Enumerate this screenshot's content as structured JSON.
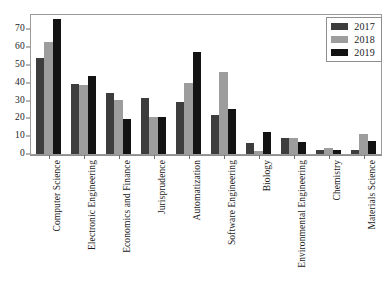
{
  "chart_data": {
    "type": "bar",
    "title": "",
    "subtitle": "",
    "xlabel": "",
    "ylabel": "",
    "ylim": [
      0,
      78
    ],
    "yticks": [
      0,
      10,
      20,
      30,
      40,
      50,
      60,
      70
    ],
    "ytick_labels": [
      "0",
      "10",
      "20",
      "30",
      "40",
      "50",
      "60",
      "70"
    ],
    "grid": false,
    "legend_position": "top-right",
    "categories": [
      "Computer Science",
      "Electronic Engineering",
      "Economics and Finance",
      "Jurisprudence",
      "Automatization",
      "Software Engineering",
      "Biology",
      "Environmental Engineering",
      "Chemistry",
      "Materials Science"
    ],
    "series": [
      {
        "name": "2017",
        "color": "#3d3d3d",
        "values": [
          54,
          39.5,
          34,
          31.5,
          29,
          22,
          6,
          9,
          2,
          2
        ]
      },
      {
        "name": "2018",
        "color": "#9d9d9d",
        "values": [
          63,
          38.5,
          30.5,
          21,
          40,
          46,
          1.5,
          9,
          3.5,
          11
        ]
      },
      {
        "name": "2019",
        "color": "#131313",
        "values": [
          76,
          44,
          19.5,
          21,
          57,
          25,
          12.5,
          6.5,
          2.5,
          7.5
        ]
      }
    ]
  },
  "legend": {
    "entries": [
      {
        "label": "2017"
      },
      {
        "label": "2018"
      },
      {
        "label": "2019"
      }
    ]
  }
}
